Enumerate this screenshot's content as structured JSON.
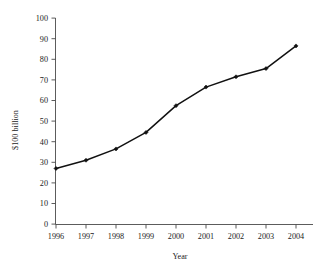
{
  "chart_data": {
    "type": "line",
    "title": "",
    "subtitle": "",
    "xlabel": "Year",
    "ylabel": "$100 billion",
    "categories": [
      "1996",
      "1997",
      "1998",
      "1999",
      "2000",
      "2001",
      "2002",
      "2003",
      "2004"
    ],
    "values": [
      27,
      31,
      36.5,
      44.5,
      57.5,
      66.5,
      71.5,
      75.5,
      86.5
    ],
    "series": [
      {
        "name": "",
        "values": [
          27,
          31,
          36.5,
          44.5,
          57.5,
          66.5,
          71.5,
          75.5,
          86.5
        ]
      }
    ],
    "x_tick_labels": [
      "1996",
      "1997",
      "1998",
      "1999",
      "2000",
      "2001",
      "2002",
      "2003",
      "2004"
    ],
    "y_tick_labels": [
      "0",
      "10",
      "20",
      "30",
      "40",
      "50",
      "60",
      "70",
      "80",
      "90",
      "100"
    ],
    "y_ticks": [
      0,
      10,
      20,
      30,
      40,
      50,
      60,
      70,
      80,
      90,
      100
    ],
    "ylim": [
      0,
      100
    ],
    "grid": false,
    "legend": false,
    "legend_position": "none",
    "marker": "filled-diamond",
    "line_color": "#111111",
    "marker_color": "#111111",
    "axis_color": "#4a4a4a",
    "background_color": "#ffffff",
    "annotations": []
  },
  "axes": {
    "y_title": "$100 billion",
    "x_title": "Year",
    "y_labels": [
      "100",
      "90",
      "80",
      "70",
      "60",
      "50",
      "40",
      "30",
      "20",
      "10",
      "0"
    ],
    "x_labels": [
      "1996",
      "1997",
      "1998",
      "1999",
      "2000",
      "2001",
      "2002",
      "2003",
      "2004"
    ]
  }
}
